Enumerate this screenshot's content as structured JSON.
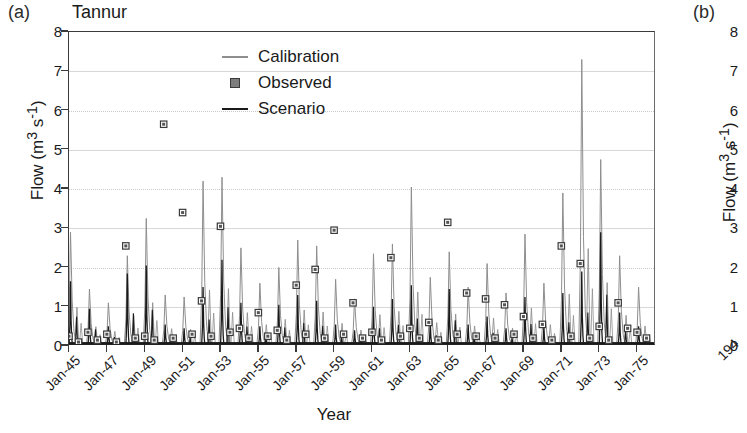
{
  "figure": {
    "panel_a_label": "(a)",
    "panel_b_label": "(b)",
    "title": "Tannur",
    "xlabel": "Year",
    "ylabel": "Flow (m3 s-1)",
    "ylabel_parts": {
      "name": "Flow (m",
      "sup1": "3",
      "mid": " s",
      "sup2": "-1",
      "close": ")"
    }
  },
  "legend": {
    "position": "top-center-inside",
    "items": [
      {
        "label": "Calibration",
        "key": "thin-gray-line",
        "color": "#8e8e8e"
      },
      {
        "label": "Observed",
        "key": "open-square-marker",
        "color": "#3a3a3a"
      },
      {
        "label": "Scenario",
        "key": "thick-black-line",
        "color": "#1a1a1a"
      }
    ]
  },
  "panel_b": {
    "label": "(b)",
    "ylabel": "Flow (m3 s-1)",
    "yticks": [
      8,
      7,
      6,
      5,
      4,
      3,
      2,
      1,
      0
    ],
    "xtick_partial": "194"
  },
  "chart_data": {
    "type": "line",
    "title": "Tannur",
    "xlabel": "Year",
    "ylabel": "Flow (m3 s-1)",
    "ylim": [
      0,
      8
    ],
    "yticks": [
      0,
      1,
      2,
      3,
      4,
      5,
      6,
      7,
      8
    ],
    "grid": true,
    "xlim": [
      "Jan-45",
      "Jan-76"
    ],
    "xticks": [
      "Jan-45",
      "Jan-47",
      "Jan-49",
      "Jan-51",
      "Jan-53",
      "Jan-55",
      "Jan-57",
      "Jan-59",
      "Jan-61",
      "Jan-63",
      "Jan-65",
      "Jan-67",
      "Jan-69",
      "Jan-71",
      "Jan-73",
      "Jan-75"
    ],
    "xtick_years": [
      1945,
      1947,
      1949,
      1951,
      1953,
      1955,
      1957,
      1959,
      1961,
      1963,
      1965,
      1967,
      1969,
      1971,
      1973,
      1975
    ],
    "series": [
      {
        "name": "Calibration",
        "style": "thin-gray-line",
        "color": "#8e8e8e",
        "note": "Annual spiky hydrograph, one sharp winter peak per year with near-zero baseflow",
        "annual_peaks": {
          "x": [
            1945,
            1946,
            1947,
            1948,
            1949,
            1950,
            1951,
            1952,
            1953,
            1954,
            1955,
            1956,
            1957,
            1958,
            1959,
            1960,
            1961,
            1962,
            1963,
            1964,
            1965,
            1966,
            1967,
            1968,
            1969,
            1970,
            1971,
            1972,
            1973,
            1974,
            1975
          ],
          "y": [
            2.9,
            1.45,
            1.1,
            2.3,
            3.25,
            1.3,
            1.25,
            4.2,
            4.3,
            2.5,
            1.6,
            2.0,
            2.7,
            2.55,
            1.7,
            1.2,
            2.35,
            2.6,
            4.05,
            1.75,
            2.4,
            1.5,
            2.1,
            1.35,
            2.85,
            1.6,
            3.9,
            7.3,
            4.75,
            2.3,
            1.5
          ]
        }
      },
      {
        "name": "Scenario",
        "style": "thick-black-line",
        "color": "#1a1a1a",
        "note": "Lower, heavily damped hydrograph hugging the zero baseline with short peaks",
        "annual_peaks": {
          "x": [
            1945,
            1946,
            1947,
            1948,
            1949,
            1950,
            1951,
            1952,
            1953,
            1954,
            1955,
            1956,
            1957,
            1958,
            1959,
            1960,
            1961,
            1962,
            1963,
            1964,
            1965,
            1966,
            1967,
            1968,
            1969,
            1970,
            1971,
            1972,
            1973,
            1974,
            1975
          ],
          "y": [
            1.65,
            0.95,
            0.5,
            1.85,
            2.05,
            0.55,
            0.45,
            1.5,
            2.2,
            1.1,
            0.5,
            1.05,
            1.3,
            1.15,
            0.55,
            0.4,
            1.0,
            1.2,
            1.55,
            0.6,
            1.45,
            0.55,
            0.75,
            0.45,
            1.25,
            0.5,
            1.35,
            1.9,
            2.9,
            0.85,
            0.5
          ]
        }
      },
      {
        "name": "Observed",
        "style": "open-square-marker",
        "color": "#3a3a3a",
        "note": "Discrete annual observed flow values; most near the baseline, several high outliers",
        "points": {
          "x": [
            1945,
            1945.5,
            1946,
            1946.5,
            1947,
            1947.5,
            1948,
            1948.5,
            1949,
            1949.5,
            1950,
            1950.5,
            1951,
            1951.5,
            1952,
            1952.5,
            1953,
            1953.5,
            1954,
            1954.5,
            1955,
            1955.5,
            1956,
            1956.5,
            1957,
            1957.5,
            1958,
            1958.5,
            1959,
            1959.5,
            1960,
            1960.5,
            1961,
            1961.5,
            1962,
            1962.5,
            1963,
            1963.5,
            1964,
            1964.5,
            1965,
            1965.5,
            1966,
            1966.5,
            1967,
            1967.5,
            1968,
            1968.5,
            1969,
            1969.5,
            1970,
            1970.5,
            1971,
            1971.5,
            1972,
            1972.5,
            1973,
            1973.5,
            1974,
            1974.5,
            1975,
            1975.5
          ],
          "y": [
            0.25,
            0.1,
            0.35,
            0.15,
            0.3,
            0.1,
            2.55,
            0.2,
            0.25,
            0.15,
            5.65,
            0.2,
            3.4,
            0.3,
            1.15,
            0.25,
            3.05,
            0.35,
            0.45,
            0.2,
            0.85,
            0.25,
            0.4,
            0.15,
            1.55,
            0.3,
            1.95,
            0.2,
            2.95,
            0.3,
            1.1,
            0.2,
            0.35,
            0.15,
            2.25,
            0.25,
            0.45,
            0.2,
            0.6,
            0.15,
            3.15,
            0.3,
            1.35,
            0.25,
            1.2,
            0.2,
            1.05,
            0.3,
            0.75,
            0.2,
            0.55,
            0.15,
            2.55,
            0.25,
            2.1,
            0.2,
            0.5,
            0.15,
            1.1,
            0.45,
            0.35,
            0.2
          ]
        },
        "high_outliers": [
          {
            "year": 1950,
            "value": 5.65
          },
          {
            "year": 1951,
            "value": 3.4
          },
          {
            "year": 1953,
            "value": 3.05
          },
          {
            "year": 1959,
            "value": 2.95
          },
          {
            "year": 1965,
            "value": 3.15
          },
          {
            "year": 1948,
            "value": 2.55
          },
          {
            "year": 1971,
            "value": 2.55
          },
          {
            "year": 1962,
            "value": 2.25
          },
          {
            "year": 1972,
            "value": 2.1
          }
        ]
      }
    ],
    "max_value": 7.3,
    "max_value_series": "Calibration",
    "max_value_year": 1972
  }
}
